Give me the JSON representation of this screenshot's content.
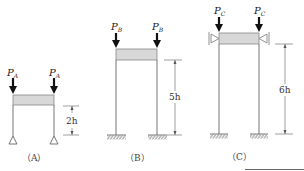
{
  "figures": [
    {
      "id": "A",
      "caption": "（A）",
      "load_label": "P",
      "load_sub": "A",
      "height_label": "2h",
      "base_support": "pin",
      "top_restraint": "none"
    },
    {
      "id": "B",
      "caption": "（B）",
      "load_label": "P",
      "load_sub": "B",
      "height_label": "5h",
      "base_support": "fixed",
      "top_restraint": "none"
    },
    {
      "id": "C",
      "caption": "（C）",
      "load_label": "P",
      "load_sub": "C",
      "height_label": "6h",
      "base_support": "fixed",
      "top_restraint": "lateral-roller"
    }
  ],
  "colors": {
    "line": "#555555",
    "arrow": "#111111",
    "beam_fill": "#d8d8d8",
    "beam_stroke": "#888888"
  }
}
